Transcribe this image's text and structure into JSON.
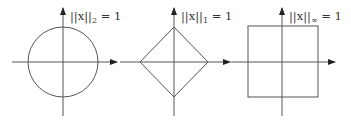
{
  "diagram": {
    "stroke_color": "#555555",
    "panels": [
      {
        "shape": "circle",
        "label_prefix": "||x||",
        "label_sub": "2",
        "label_suffix": " = 1"
      },
      {
        "shape": "diamond",
        "label_prefix": "||x||",
        "label_sub": "1",
        "label_suffix": " = 1"
      },
      {
        "shape": "square",
        "label_prefix": "||x||",
        "label_sub": "∞",
        "label_suffix": " = 1"
      }
    ]
  }
}
